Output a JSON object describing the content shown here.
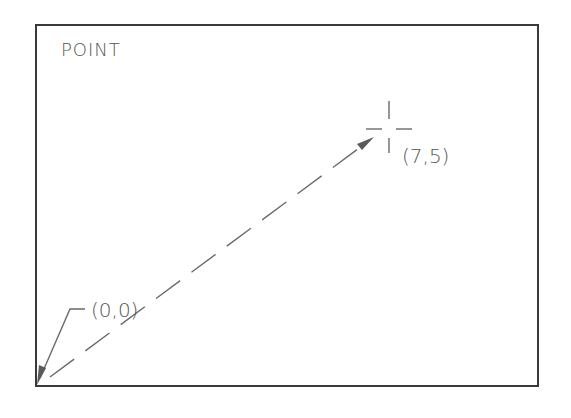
{
  "diagram": {
    "title": "POINT",
    "origin_label": "(0,0)",
    "point_label": "(7,5)",
    "colors": {
      "frame": "#3a3a3a",
      "lines": "#6a6a6a",
      "text": "#555555",
      "background": "#ffffff"
    },
    "elements": {
      "frame": "drawing-area-border",
      "vector": "dashed-arrow-from-origin-to-point",
      "marker": "crosshair-point-marker",
      "leader": "origin-leader-arrow"
    }
  }
}
